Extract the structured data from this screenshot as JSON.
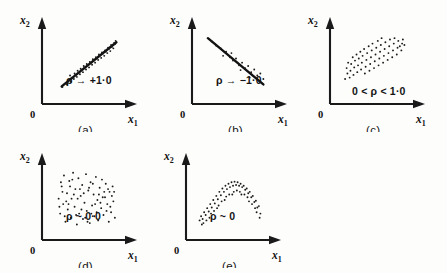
{
  "figure": {
    "background_color": "#fdfdfc",
    "ink_color": "#1a1a1a",
    "axis_labels": {
      "x_axis": "x",
      "x_axis_sub": "1",
      "y_axis": "x",
      "y_axis_sub": "2",
      "origin": "0"
    }
  },
  "panels": [
    {
      "id": "a",
      "caption": "(a)",
      "annotation": "ρ → +1·0",
      "description": "tight positively-correlated scatter about a rising straight line",
      "has_trend_line": true
    },
    {
      "id": "b",
      "caption": "(b)",
      "annotation": "ρ → −1·0",
      "description": "negatively-correlated scatter about a falling straight line",
      "has_trend_line": true
    },
    {
      "id": "c",
      "caption": "(c)",
      "annotation": "0 < ρ < 1·0",
      "description": "elongated ellipse of points tilted upward, moderate positive correlation",
      "has_trend_line": false
    },
    {
      "id": "d",
      "caption": "(d)",
      "annotation": "ρ ~ 0·0",
      "description": "diffuse circular cloud of points, no correlation",
      "has_trend_line": false
    },
    {
      "id": "e",
      "caption": "(e)",
      "annotation": "ρ ~ 0",
      "description": "inverted-U arch band of points, nonlinear relation with zero linear correlation",
      "has_trend_line": false
    }
  ],
  "chart_data": {
    "type": "scatter",
    "title": "",
    "xlabel": "x1",
    "ylabel": "x2",
    "grid": false,
    "legend": "none",
    "panels": [
      {
        "id": "a",
        "caption": "(a)",
        "annotation": "ρ → +1·0",
        "correlation": 0.97,
        "trend_line": {
          "x1": 0.18,
          "y1": 0.17,
          "x2": 0.9,
          "y2": 0.82
        },
        "points": [
          [
            0.19,
            0.16
          ],
          [
            0.22,
            0.21
          ],
          [
            0.25,
            0.2
          ],
          [
            0.27,
            0.26
          ],
          [
            0.3,
            0.24
          ],
          [
            0.31,
            0.3
          ],
          [
            0.34,
            0.28
          ],
          [
            0.36,
            0.34
          ],
          [
            0.38,
            0.31
          ],
          [
            0.4,
            0.37
          ],
          [
            0.42,
            0.35
          ],
          [
            0.44,
            0.41
          ],
          [
            0.46,
            0.38
          ],
          [
            0.48,
            0.45
          ],
          [
            0.5,
            0.42
          ],
          [
            0.52,
            0.48
          ],
          [
            0.54,
            0.45
          ],
          [
            0.56,
            0.52
          ],
          [
            0.58,
            0.49
          ],
          [
            0.6,
            0.55
          ],
          [
            0.62,
            0.52
          ],
          [
            0.64,
            0.58
          ],
          [
            0.66,
            0.56
          ],
          [
            0.68,
            0.62
          ],
          [
            0.7,
            0.59
          ],
          [
            0.72,
            0.65
          ],
          [
            0.74,
            0.62
          ],
          [
            0.76,
            0.68
          ],
          [
            0.78,
            0.66
          ],
          [
            0.8,
            0.72
          ],
          [
            0.82,
            0.69
          ],
          [
            0.84,
            0.75
          ],
          [
            0.86,
            0.73
          ],
          [
            0.88,
            0.79
          ],
          [
            0.89,
            0.84
          ],
          [
            0.87,
            0.81
          ],
          [
            0.83,
            0.78
          ],
          [
            0.79,
            0.74
          ],
          [
            0.75,
            0.7
          ],
          [
            0.71,
            0.67
          ],
          [
            0.67,
            0.64
          ],
          [
            0.63,
            0.6
          ],
          [
            0.59,
            0.57
          ],
          [
            0.55,
            0.53
          ],
          [
            0.51,
            0.5
          ],
          [
            0.47,
            0.47
          ],
          [
            0.43,
            0.43
          ],
          [
            0.39,
            0.4
          ],
          [
            0.35,
            0.36
          ],
          [
            0.29,
            0.33
          ]
        ]
      },
      {
        "id": "b",
        "caption": "(b)",
        "annotation": "ρ → −1·0",
        "correlation": -0.95,
        "trend_line": {
          "x1": 0.13,
          "y1": 0.88,
          "x2": 0.86,
          "y2": 0.2
        },
        "points": [
          [
            0.18,
            0.83
          ],
          [
            0.24,
            0.77
          ],
          [
            0.3,
            0.73
          ],
          [
            0.33,
            0.62
          ],
          [
            0.37,
            0.68
          ],
          [
            0.42,
            0.6
          ],
          [
            0.46,
            0.55
          ],
          [
            0.5,
            0.58
          ],
          [
            0.54,
            0.48
          ],
          [
            0.58,
            0.52
          ],
          [
            0.62,
            0.44
          ],
          [
            0.66,
            0.47
          ],
          [
            0.7,
            0.38
          ],
          [
            0.74,
            0.42
          ],
          [
            0.78,
            0.33
          ],
          [
            0.82,
            0.36
          ],
          [
            0.86,
            0.28
          ],
          [
            0.44,
            0.66
          ],
          [
            0.56,
            0.41
          ],
          [
            0.68,
            0.3
          ]
        ]
      },
      {
        "id": "c",
        "caption": "(c)",
        "annotation": "0 < ρ < 1·0",
        "correlation": 0.7,
        "trend_line": null,
        "points": [
          [
            0.12,
            0.28
          ],
          [
            0.15,
            0.36
          ],
          [
            0.14,
            0.44
          ],
          [
            0.18,
            0.3
          ],
          [
            0.19,
            0.4
          ],
          [
            0.2,
            0.5
          ],
          [
            0.23,
            0.34
          ],
          [
            0.24,
            0.45
          ],
          [
            0.25,
            0.55
          ],
          [
            0.28,
            0.38
          ],
          [
            0.29,
            0.48
          ],
          [
            0.3,
            0.58
          ],
          [
            0.33,
            0.42
          ],
          [
            0.34,
            0.52
          ],
          [
            0.35,
            0.62
          ],
          [
            0.38,
            0.36
          ],
          [
            0.39,
            0.46
          ],
          [
            0.4,
            0.56
          ],
          [
            0.41,
            0.66
          ],
          [
            0.44,
            0.4
          ],
          [
            0.45,
            0.5
          ],
          [
            0.46,
            0.6
          ],
          [
            0.47,
            0.7
          ],
          [
            0.5,
            0.44
          ],
          [
            0.51,
            0.54
          ],
          [
            0.52,
            0.64
          ],
          [
            0.53,
            0.74
          ],
          [
            0.56,
            0.48
          ],
          [
            0.57,
            0.58
          ],
          [
            0.58,
            0.68
          ],
          [
            0.59,
            0.78
          ],
          [
            0.62,
            0.52
          ],
          [
            0.63,
            0.62
          ],
          [
            0.64,
            0.72
          ],
          [
            0.65,
            0.82
          ],
          [
            0.68,
            0.56
          ],
          [
            0.69,
            0.66
          ],
          [
            0.7,
            0.76
          ],
          [
            0.71,
            0.86
          ],
          [
            0.74,
            0.6
          ],
          [
            0.75,
            0.7
          ],
          [
            0.76,
            0.8
          ],
          [
            0.77,
            0.88
          ],
          [
            0.8,
            0.64
          ],
          [
            0.81,
            0.74
          ],
          [
            0.82,
            0.84
          ],
          [
            0.86,
            0.7
          ],
          [
            0.87,
            0.8
          ],
          [
            0.88,
            0.86
          ],
          [
            0.9,
            0.78
          ],
          [
            0.22,
            0.6
          ],
          [
            0.32,
            0.68
          ],
          [
            0.43,
            0.76
          ],
          [
            0.55,
            0.84
          ],
          [
            0.16,
            0.52
          ],
          [
            0.27,
            0.64
          ],
          [
            0.37,
            0.72
          ],
          [
            0.48,
            0.8
          ],
          [
            0.6,
            0.88
          ],
          [
            0.84,
            0.76
          ]
        ]
      },
      {
        "id": "d",
        "caption": "(d)",
        "annotation": "ρ ~ 0·0",
        "correlation": 0.0,
        "trend_line": null,
        "points": [
          [
            0.14,
            0.52
          ],
          [
            0.16,
            0.3
          ],
          [
            0.18,
            0.7
          ],
          [
            0.2,
            0.44
          ],
          [
            0.21,
            0.86
          ],
          [
            0.23,
            0.18
          ],
          [
            0.25,
            0.6
          ],
          [
            0.26,
            0.36
          ],
          [
            0.28,
            0.78
          ],
          [
            0.3,
            0.24
          ],
          [
            0.31,
            0.52
          ],
          [
            0.33,
            0.9
          ],
          [
            0.35,
            0.4
          ],
          [
            0.36,
            0.66
          ],
          [
            0.38,
            0.14
          ],
          [
            0.4,
            0.82
          ],
          [
            0.41,
            0.3
          ],
          [
            0.43,
            0.56
          ],
          [
            0.45,
            0.72
          ],
          [
            0.46,
            0.22
          ],
          [
            0.48,
            0.46
          ],
          [
            0.5,
            0.88
          ],
          [
            0.51,
            0.34
          ],
          [
            0.53,
            0.64
          ],
          [
            0.55,
            0.16
          ],
          [
            0.56,
            0.76
          ],
          [
            0.58,
            0.42
          ],
          [
            0.6,
            0.58
          ],
          [
            0.61,
            0.26
          ],
          [
            0.63,
            0.84
          ],
          [
            0.65,
            0.5
          ],
          [
            0.66,
            0.2
          ],
          [
            0.68,
            0.68
          ],
          [
            0.7,
            0.38
          ],
          [
            0.71,
            0.8
          ],
          [
            0.73,
            0.28
          ],
          [
            0.75,
            0.54
          ],
          [
            0.76,
            0.74
          ],
          [
            0.78,
            0.44
          ],
          [
            0.8,
            0.18
          ],
          [
            0.81,
            0.62
          ],
          [
            0.83,
            0.32
          ],
          [
            0.85,
            0.7
          ],
          [
            0.86,
            0.48
          ],
          [
            0.88,
            0.24
          ],
          [
            0.15,
            0.4
          ],
          [
            0.24,
            0.48
          ],
          [
            0.34,
            0.58
          ],
          [
            0.44,
            0.36
          ],
          [
            0.54,
            0.68
          ],
          [
            0.64,
            0.32
          ],
          [
            0.74,
            0.62
          ],
          [
            0.84,
            0.56
          ],
          [
            0.19,
            0.62
          ],
          [
            0.29,
            0.7
          ],
          [
            0.39,
            0.52
          ],
          [
            0.49,
            0.24
          ],
          [
            0.59,
            0.74
          ],
          [
            0.69,
            0.46
          ],
          [
            0.79,
            0.66
          ],
          [
            0.22,
            0.26
          ],
          [
            0.32,
            0.8
          ],
          [
            0.42,
            0.66
          ],
          [
            0.52,
            0.18
          ],
          [
            0.62,
            0.44
          ],
          [
            0.72,
            0.54
          ],
          [
            0.82,
            0.4
          ],
          [
            0.17,
            0.76
          ],
          [
            0.27,
            0.44
          ],
          [
            0.37,
            0.28
          ],
          [
            0.47,
            0.6
          ],
          [
            0.57,
            0.3
          ],
          [
            0.67,
            0.58
          ],
          [
            0.77,
            0.34
          ],
          [
            0.87,
            0.62
          ]
        ]
      },
      {
        "id": "e",
        "caption": "(e)",
        "annotation": "ρ ~ 0",
        "correlation": 0.0,
        "trend_line": null,
        "points": [
          [
            0.1,
            0.2
          ],
          [
            0.12,
            0.26
          ],
          [
            0.14,
            0.22
          ],
          [
            0.16,
            0.32
          ],
          [
            0.18,
            0.28
          ],
          [
            0.2,
            0.38
          ],
          [
            0.22,
            0.33
          ],
          [
            0.24,
            0.44
          ],
          [
            0.26,
            0.39
          ],
          [
            0.28,
            0.5
          ],
          [
            0.3,
            0.45
          ],
          [
            0.32,
            0.56
          ],
          [
            0.34,
            0.51
          ],
          [
            0.36,
            0.62
          ],
          [
            0.38,
            0.57
          ],
          [
            0.4,
            0.67
          ],
          [
            0.42,
            0.62
          ],
          [
            0.44,
            0.71
          ],
          [
            0.46,
            0.66
          ],
          [
            0.48,
            0.74
          ],
          [
            0.5,
            0.69
          ],
          [
            0.52,
            0.76
          ],
          [
            0.54,
            0.71
          ],
          [
            0.56,
            0.77
          ],
          [
            0.58,
            0.72
          ],
          [
            0.6,
            0.76
          ],
          [
            0.62,
            0.71
          ],
          [
            0.64,
            0.74
          ],
          [
            0.66,
            0.69
          ],
          [
            0.68,
            0.71
          ],
          [
            0.7,
            0.65
          ],
          [
            0.72,
            0.67
          ],
          [
            0.74,
            0.6
          ],
          [
            0.76,
            0.62
          ],
          [
            0.78,
            0.54
          ],
          [
            0.8,
            0.56
          ],
          [
            0.82,
            0.47
          ],
          [
            0.84,
            0.49
          ],
          [
            0.86,
            0.39
          ],
          [
            0.88,
            0.41
          ],
          [
            0.9,
            0.3
          ],
          [
            0.15,
            0.16
          ],
          [
            0.25,
            0.3
          ],
          [
            0.35,
            0.42
          ],
          [
            0.45,
            0.55
          ],
          [
            0.55,
            0.62
          ],
          [
            0.65,
            0.58
          ],
          [
            0.75,
            0.48
          ],
          [
            0.85,
            0.32
          ],
          [
            0.89,
            0.24
          ],
          [
            0.19,
            0.2
          ],
          [
            0.29,
            0.34
          ],
          [
            0.39,
            0.48
          ],
          [
            0.49,
            0.58
          ],
          [
            0.59,
            0.64
          ],
          [
            0.69,
            0.58
          ],
          [
            0.79,
            0.44
          ],
          [
            0.33,
            0.38
          ],
          [
            0.43,
            0.5
          ],
          [
            0.53,
            0.58
          ],
          [
            0.63,
            0.62
          ],
          [
            0.73,
            0.54
          ],
          [
            0.83,
            0.38
          ],
          [
            0.23,
            0.24
          ],
          [
            0.13,
            0.14
          ]
        ]
      }
    ]
  }
}
